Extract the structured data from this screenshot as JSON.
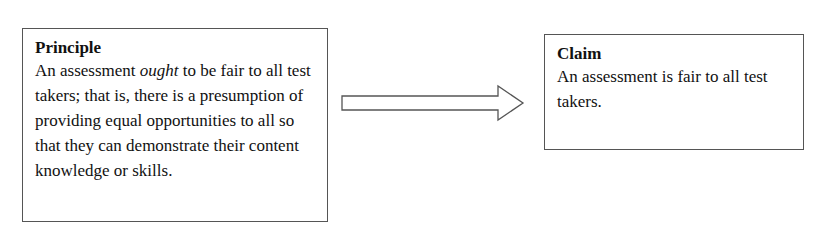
{
  "principle": {
    "title": "Principle",
    "text_before": "An assessment ",
    "text_italic": "ought",
    "text_after": " to be fair to all test takers; that is, there is a presumption of providing equal opportunities to all so that they can demonstrate their content knowledge or skills."
  },
  "arrow": {
    "direction": "right"
  },
  "claim": {
    "title": "Claim",
    "text": "An assessment is fair to all test takers."
  }
}
